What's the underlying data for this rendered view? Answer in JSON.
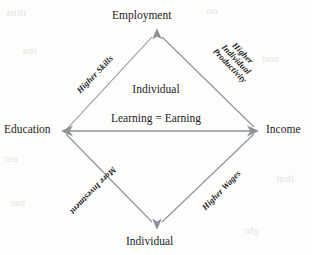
{
  "diagram": {
    "shape": "diamond",
    "line_color": "#8d9099",
    "text_color": "#1c1c1c",
    "nodes": {
      "top": "Employment",
      "left": "Education",
      "right": "Income",
      "bottom": "Individual"
    },
    "center": {
      "line1": "Individual",
      "line2": "Learning = Earning"
    },
    "edges": [
      {
        "id": "education-to-employment",
        "position": "upper-left",
        "label": "Higher Skills",
        "rotation_deg": -46
      },
      {
        "id": "employment-to-income",
        "position": "upper-right",
        "label": "Higher Individual Productivity",
        "label_line1": "Higher",
        "label_line2": "Individual",
        "label_line3": "Productivity",
        "rotation_deg": 46
      },
      {
        "id": "income-to-individual",
        "position": "lower-right",
        "label": "Higher Wages",
        "rotation_deg": -46
      },
      {
        "id": "individual-to-education",
        "position": "lower-left",
        "label": "More Investment",
        "rotation_deg": 134
      }
    ],
    "arrowheads": [
      {
        "id": "arrowhead-top",
        "points": "up",
        "at": "Employment"
      },
      {
        "id": "arrowhead-left",
        "points": "left",
        "at": "Education"
      },
      {
        "id": "arrowhead-right",
        "points": "right",
        "at": "Income"
      },
      {
        "id": "arrowhead-bottom",
        "points": "down",
        "at": "Individual"
      }
    ]
  },
  "page_bleed": {
    "row1": "thus",
    "row2": "on",
    "row3": "the",
    "row4": "and",
    "row5": "est",
    "row6": "that",
    "row7": "ber",
    "row8": "ght"
  }
}
